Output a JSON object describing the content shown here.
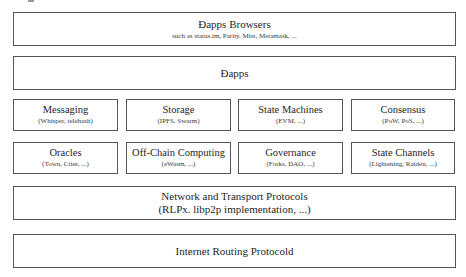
{
  "diagram": {
    "layers": [
      {
        "id": "dapps-browsers",
        "title": "Ðapps Browsers",
        "subtitle": "such as status.im, Parity, Mist, Metamask, ..."
      },
      {
        "id": "dapps",
        "title": "Ðapps"
      },
      {
        "id": "services-row-1",
        "items": [
          {
            "title": "Messaging",
            "subtitle": "(Whisper, telehash)"
          },
          {
            "title": "Storage",
            "subtitle": "(IPFS, Swarm)"
          },
          {
            "title": "State Machines",
            "subtitle": "(EVM, ...)"
          },
          {
            "title": "Consensus",
            "subtitle": "(PoW, PoS, ...)"
          }
        ]
      },
      {
        "id": "services-row-2",
        "items": [
          {
            "title": "Oracles",
            "subtitle": "(Town, Crier, ...)"
          },
          {
            "title": "Off-Chain Computing",
            "subtitle": "(eWasm, ...)"
          },
          {
            "title": "Governance",
            "subtitle": "(Forks, DAO, ...)"
          },
          {
            "title": "State Channels",
            "subtitle": "(Lightening, Raiden, ...)"
          }
        ]
      },
      {
        "id": "network-transport",
        "title": "Network and Transport Protocols",
        "subtitle": "(RLPx. libp2p implementation, ...)"
      },
      {
        "id": "internet-routing",
        "title": "Internet Routing Protocold"
      }
    ],
    "colors": {
      "border": "#555555",
      "text": "#262626",
      "background": "#ffffff"
    }
  }
}
